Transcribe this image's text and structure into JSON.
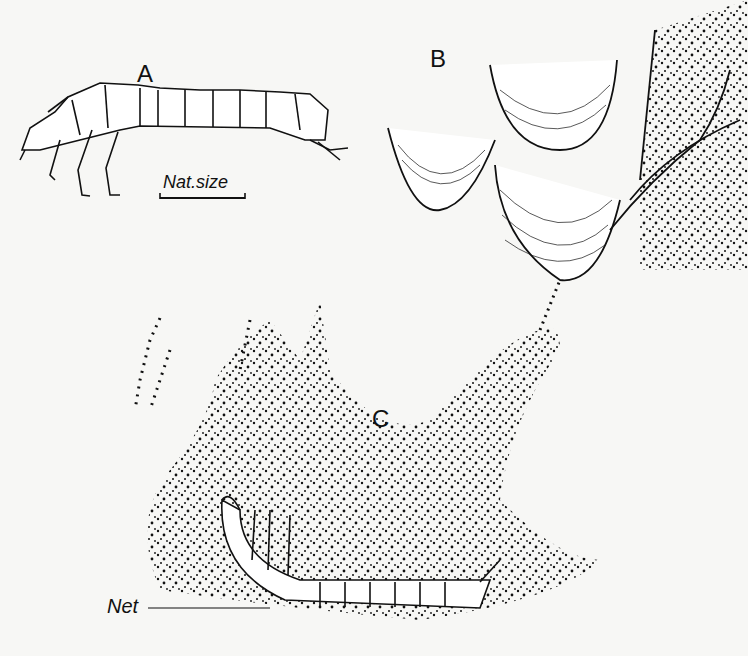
{
  "page": {
    "type": "scanned book illustration page",
    "background": "#f7f7f5",
    "ink": "#111111"
  },
  "figure": {
    "panels": [
      {
        "id": "A",
        "label": "A",
        "description": "larva, side view",
        "scale_label": "Nat.size"
      },
      {
        "id": "B",
        "label": "B",
        "description": "cup-shaped cases / nets attached to rock surface"
      },
      {
        "id": "C",
        "label": "C",
        "description": "larva lying in silk net spread across stone",
        "callouts": [
          {
            "label": "Net"
          }
        ]
      }
    ]
  },
  "labels": {
    "a": "A",
    "b": "B",
    "c": "C",
    "scale": "Nat.size",
    "net": "Net"
  }
}
